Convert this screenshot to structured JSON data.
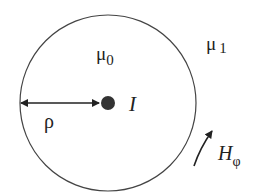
{
  "diagram": {
    "labels": {
      "inner_medium": "μ",
      "inner_medium_sub": "0",
      "outer_medium": "μ",
      "outer_medium_sub": "1",
      "radius": "ρ",
      "current": "I",
      "field": "H",
      "field_sub": "φ"
    },
    "colors": {
      "line": "#333333",
      "dot": "#333333",
      "background": "#ffffff"
    }
  }
}
